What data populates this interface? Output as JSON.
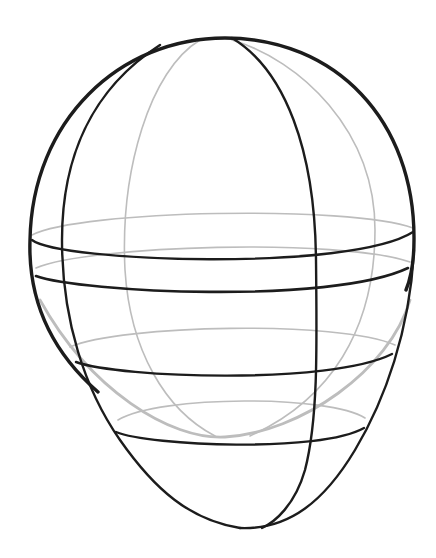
{
  "figure": {
    "colors": {
      "background": "#ffffff",
      "front_lines": "#1c1c1c",
      "back_lines": "#bdbdbd"
    },
    "elements": [
      "cranium-outline",
      "jaw-outline",
      "center-meridian",
      "side-meridian",
      "hidden-meridians",
      "equator-ring",
      "brow-ring",
      "nose-ring",
      "mouth-ring",
      "sphere-bottom-arc"
    ]
  }
}
